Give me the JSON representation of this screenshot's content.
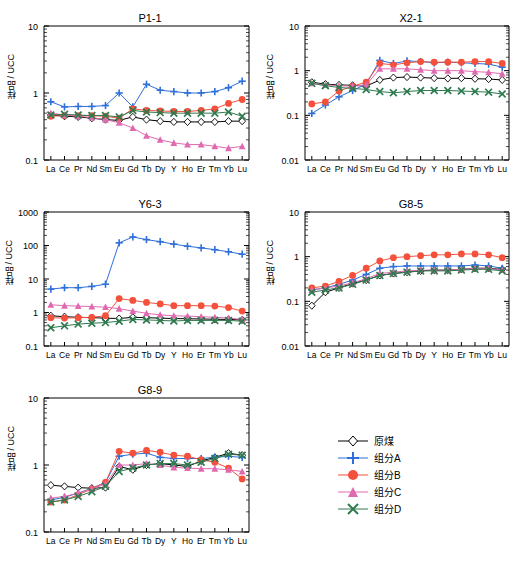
{
  "ylabel": "样品 / UCC",
  "legend": {
    "items": [
      {
        "label": "原煤",
        "marker": "diamond",
        "color": "#000000"
      },
      {
        "label": "组分A",
        "marker": "plus",
        "color": "#2e6fd9"
      },
      {
        "label": "组分B",
        "marker": "circle",
        "color": "#f4503c"
      },
      {
        "label": "组分C",
        "marker": "triangle",
        "color": "#e06ab0"
      },
      {
        "label": "组分D",
        "marker": "cross",
        "color": "#2f7a4f"
      }
    ]
  },
  "chart_data": [
    {
      "type": "line",
      "title": "P1-1",
      "xlabel": "",
      "ylabel": "样品 / UCC",
      "categories": [
        "La",
        "Ce",
        "Pr",
        "Nd",
        "Sm",
        "Eu",
        "Gd",
        "Tb",
        "Dy",
        "Y",
        "Ho",
        "Er",
        "Tm",
        "Yb",
        "Lu"
      ],
      "ylim": [
        0.1,
        10
      ],
      "yticks": [
        0.1,
        1,
        10
      ],
      "ytick_labels": [
        "0.1",
        "1",
        "10"
      ],
      "grid": false,
      "legend_position": "external",
      "series": [
        {
          "name": "原煤",
          "marker": "diamond",
          "color": "#000000",
          "values": [
            0.47,
            0.45,
            0.44,
            0.42,
            0.4,
            0.39,
            0.44,
            0.4,
            0.38,
            0.37,
            0.37,
            0.37,
            0.37,
            0.38,
            0.38
          ]
        },
        {
          "name": "组分A",
          "marker": "plus",
          "color": "#2e6fd9",
          "values": [
            0.74,
            0.62,
            0.63,
            0.63,
            0.65,
            1.0,
            0.62,
            1.35,
            1.1,
            1.05,
            1.0,
            1.0,
            1.05,
            1.2,
            1.5
          ]
        },
        {
          "name": "组分B",
          "marker": "circle",
          "color": "#f4503c",
          "values": [
            0.45,
            0.46,
            0.46,
            0.46,
            0.45,
            0.42,
            0.58,
            0.55,
            0.54,
            0.53,
            0.53,
            0.55,
            0.58,
            0.7,
            0.8
          ]
        },
        {
          "name": "组分C",
          "marker": "triangle",
          "color": "#e06ab0",
          "values": [
            0.5,
            0.47,
            0.45,
            0.43,
            0.4,
            0.36,
            0.3,
            0.23,
            0.2,
            0.18,
            0.17,
            0.17,
            0.16,
            0.15,
            0.16
          ]
        },
        {
          "name": "组分D",
          "marker": "cross",
          "color": "#2f7a4f",
          "values": [
            0.47,
            0.48,
            0.47,
            0.46,
            0.46,
            0.44,
            0.55,
            0.52,
            0.51,
            0.5,
            0.5,
            0.5,
            0.5,
            0.52,
            0.45
          ]
        }
      ]
    },
    {
      "type": "line",
      "title": "X2-1",
      "xlabel": "",
      "ylabel": "样品 / UCC",
      "categories": [
        "La",
        "Ce",
        "Pr",
        "Nd",
        "Sm",
        "Eu",
        "Gd",
        "Tb",
        "Dy",
        "Y",
        "Ho",
        "Er",
        "Tm",
        "Yb",
        "Lu"
      ],
      "ylim": [
        0.01,
        10
      ],
      "yticks": [
        0.01,
        0.1,
        1,
        10
      ],
      "ytick_labels": [
        "0.01",
        "0.1",
        "1",
        "10"
      ],
      "grid": false,
      "legend_position": "external",
      "series": [
        {
          "name": "原煤",
          "marker": "diamond",
          "color": "#000000",
          "values": [
            0.55,
            0.5,
            0.48,
            0.47,
            0.45,
            0.62,
            0.7,
            0.72,
            0.7,
            0.68,
            0.67,
            0.68,
            0.66,
            0.65,
            0.62
          ]
        },
        {
          "name": "组分A",
          "marker": "plus",
          "color": "#2e6fd9",
          "values": [
            0.11,
            0.17,
            0.26,
            0.36,
            0.5,
            1.7,
            1.45,
            1.65,
            1.6,
            1.5,
            1.55,
            1.5,
            1.45,
            1.4,
            1.2
          ]
        },
        {
          "name": "组分B",
          "marker": "circle",
          "color": "#f4503c",
          "values": [
            0.18,
            0.2,
            0.35,
            0.45,
            0.55,
            1.45,
            1.35,
            1.5,
            1.6,
            1.55,
            1.55,
            1.55,
            1.6,
            1.6,
            1.45
          ]
        },
        {
          "name": "组分C",
          "marker": "triangle",
          "color": "#e06ab0",
          "values": [
            0.52,
            0.48,
            0.46,
            0.45,
            0.48,
            1.1,
            1.1,
            1.1,
            1.05,
            1.0,
            1.0,
            1.0,
            0.95,
            0.92,
            0.85
          ]
        },
        {
          "name": "组分D",
          "marker": "cross",
          "color": "#2f7a4f",
          "values": [
            0.52,
            0.46,
            0.42,
            0.4,
            0.38,
            0.34,
            0.32,
            0.34,
            0.36,
            0.36,
            0.36,
            0.35,
            0.34,
            0.33,
            0.3
          ]
        }
      ]
    },
    {
      "type": "line",
      "title": "Y6-3",
      "xlabel": "",
      "ylabel": "样品 / UCC",
      "categories": [
        "La",
        "Ce",
        "Pr",
        "Nd",
        "Sm",
        "Eu",
        "Gd",
        "Tb",
        "Dy",
        "Y",
        "Ho",
        "Er",
        "Tm",
        "Yb",
        "Lu"
      ],
      "ylim": [
        0.1,
        1000
      ],
      "yticks": [
        0.1,
        1,
        10,
        100,
        1000
      ],
      "ytick_labels": [
        "0.1",
        "1",
        "10",
        "100",
        "1000"
      ],
      "grid": false,
      "legend_position": "external",
      "series": [
        {
          "name": "原煤",
          "marker": "diamond",
          "color": "#000000",
          "values": [
            0.8,
            0.75,
            0.72,
            0.7,
            0.68,
            0.66,
            0.72,
            0.7,
            0.68,
            0.66,
            0.65,
            0.64,
            0.63,
            0.62,
            0.6
          ]
        },
        {
          "name": "组分A",
          "marker": "plus",
          "color": "#2e6fd9",
          "values": [
            5.0,
            5.5,
            5.5,
            6.0,
            7.0,
            120,
            180,
            150,
            130,
            110,
            95,
            85,
            75,
            65,
            55
          ]
        },
        {
          "name": "组分B",
          "marker": "circle",
          "color": "#f4503c",
          "values": [
            0.7,
            0.68,
            0.7,
            0.72,
            0.8,
            2.6,
            2.3,
            2.0,
            1.8,
            1.6,
            1.6,
            1.6,
            1.55,
            1.4,
            1.1
          ]
        },
        {
          "name": "组分C",
          "marker": "triangle",
          "color": "#e06ab0",
          "values": [
            1.7,
            1.6,
            1.55,
            1.5,
            1.45,
            1.3,
            1.1,
            0.95,
            0.85,
            0.8,
            0.78,
            0.75,
            0.72,
            0.68,
            0.62
          ]
        },
        {
          "name": "组分D",
          "marker": "cross",
          "color": "#2f7a4f",
          "values": [
            0.35,
            0.4,
            0.45,
            0.48,
            0.5,
            0.55,
            0.62,
            0.6,
            0.58,
            0.56,
            0.58,
            0.58,
            0.58,
            0.58,
            0.55
          ]
        }
      ]
    },
    {
      "type": "line",
      "title": "G8-5",
      "xlabel": "",
      "ylabel": "样品 / UCC",
      "categories": [
        "La",
        "Ce",
        "Pr",
        "Nd",
        "Sm",
        "Eu",
        "Gd",
        "Tb",
        "Dy",
        "Y",
        "Ho",
        "Er",
        "Tm",
        "Yb",
        "Lu"
      ],
      "ylim": [
        0.01,
        10
      ],
      "yticks": [
        0.01,
        0.1,
        1,
        10
      ],
      "ytick_labels": [
        "0.01",
        "0.1",
        "1",
        "10"
      ],
      "grid": false,
      "legend_position": "external",
      "series": [
        {
          "name": "原煤",
          "marker": "diamond",
          "color": "#000000",
          "values": [
            0.08,
            0.16,
            0.2,
            0.25,
            0.3,
            0.38,
            0.42,
            0.45,
            0.48,
            0.5,
            0.5,
            0.52,
            0.55,
            0.55,
            0.52
          ]
        },
        {
          "name": "组分A",
          "marker": "plus",
          "color": "#2e6fd9",
          "values": [
            0.18,
            0.2,
            0.24,
            0.3,
            0.4,
            0.55,
            0.6,
            0.62,
            0.62,
            0.62,
            0.62,
            0.62,
            0.65,
            0.62,
            0.55
          ]
        },
        {
          "name": "组分B",
          "marker": "circle",
          "color": "#f4503c",
          "values": [
            0.2,
            0.22,
            0.28,
            0.38,
            0.55,
            0.8,
            0.95,
            1.0,
            1.05,
            1.1,
            1.1,
            1.15,
            1.15,
            1.1,
            0.95
          ]
        },
        {
          "name": "组分C",
          "marker": "triangle",
          "color": "#e06ab0",
          "values": [
            0.18,
            0.2,
            0.22,
            0.26,
            0.32,
            0.42,
            0.45,
            0.48,
            0.5,
            0.5,
            0.5,
            0.52,
            0.55,
            0.55,
            0.5
          ]
        },
        {
          "name": "组分D",
          "marker": "cross",
          "color": "#2f7a4f",
          "values": [
            0.16,
            0.18,
            0.2,
            0.24,
            0.3,
            0.38,
            0.42,
            0.45,
            0.48,
            0.48,
            0.48,
            0.5,
            0.52,
            0.52,
            0.48
          ]
        }
      ]
    },
    {
      "type": "line",
      "title": "G8-9",
      "xlabel": "",
      "ylabel": "样品 / UCC",
      "categories": [
        "La",
        "Ce",
        "Pr",
        "Nd",
        "Sm",
        "Eu",
        "Gd",
        "Tb",
        "Dy",
        "Y",
        "Ho",
        "Er",
        "Tm",
        "Yb",
        "Lu"
      ],
      "ylim": [
        0.1,
        10
      ],
      "yticks": [
        0.1,
        1,
        10
      ],
      "ytick_labels": [
        "0.1",
        "1",
        "10"
      ],
      "grid": false,
      "legend_position": "external",
      "series": [
        {
          "name": "原煤",
          "marker": "diamond",
          "color": "#000000",
          "values": [
            0.5,
            0.48,
            0.46,
            0.45,
            0.46,
            0.95,
            0.85,
            1.0,
            1.05,
            1.0,
            0.95,
            1.15,
            1.3,
            1.5,
            1.4
          ]
        },
        {
          "name": "组分A",
          "marker": "plus",
          "color": "#2e6fd9",
          "values": [
            0.3,
            0.33,
            0.38,
            0.45,
            0.55,
            1.35,
            1.45,
            1.5,
            1.3,
            1.25,
            1.25,
            1.25,
            1.3,
            1.35,
            1.3
          ]
        },
        {
          "name": "组分B",
          "marker": "circle",
          "color": "#f4503c",
          "values": [
            0.28,
            0.3,
            0.36,
            0.44,
            0.55,
            1.6,
            1.5,
            1.65,
            1.55,
            1.4,
            1.35,
            1.2,
            1.1,
            0.9,
            0.62
          ]
        },
        {
          "name": "组分C",
          "marker": "triangle",
          "color": "#e06ab0",
          "values": [
            0.32,
            0.34,
            0.38,
            0.44,
            0.52,
            1.0,
            1.0,
            1.05,
            1.0,
            0.92,
            0.9,
            0.88,
            0.88,
            0.85,
            0.8
          ]
        },
        {
          "name": "组分D",
          "marker": "cross",
          "color": "#2f7a4f",
          "values": [
            0.28,
            0.3,
            0.34,
            0.4,
            0.48,
            0.8,
            0.9,
            1.0,
            1.05,
            1.05,
            1.0,
            1.1,
            1.25,
            1.45,
            1.4
          ]
        }
      ]
    }
  ]
}
